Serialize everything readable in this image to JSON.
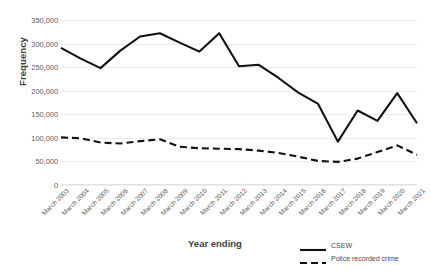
{
  "chart_data": {
    "type": "line",
    "title": "",
    "xlabel": "Year ending",
    "ylabel": "Frequency",
    "ylim": [
      0,
      350000
    ],
    "ytick_step": 50000,
    "grid": true,
    "legend_position": "bottom-right",
    "categories": [
      "March 2003",
      "March 2004",
      "March 2005",
      "March 2006",
      "March 2007",
      "March 2008",
      "March 2009",
      "March 2010",
      "March 2011",
      "March 2012",
      "March 2013",
      "March 2014",
      "March 2015",
      "March 2016",
      "March 2017",
      "March 2018",
      "March 2019",
      "March 2020",
      "March 2021"
    ],
    "ytick_labels": [
      "350,000",
      "300,000",
      "250,000",
      "200,000",
      "150,000",
      "100,000",
      "50,000",
      "0"
    ],
    "ytick_values": [
      350000,
      300000,
      250000,
      200000,
      150000,
      100000,
      50000,
      0
    ],
    "series": [
      {
        "name": "CSEW",
        "style": "solid",
        "color": "#111111",
        "values": [
          291000,
          268000,
          248000,
          285000,
          315000,
          322000,
          302000,
          283000,
          322000,
          252000,
          255000,
          227000,
          196000,
          172000,
          92000,
          158000,
          136000,
          195000,
          131000
        ]
      },
      {
        "name": "Police recorded crime",
        "style": "dashed",
        "color": "#111111",
        "values": [
          101000,
          99000,
          90000,
          88000,
          93000,
          97000,
          81000,
          78000,
          77000,
          76000,
          73000,
          68000,
          60000,
          51000,
          49000,
          56000,
          70000,
          84000,
          64000
        ]
      }
    ]
  },
  "legend": {
    "items": [
      {
        "label": "CSEW",
        "style": "solid"
      },
      {
        "label": "Police recorded crime",
        "style": "dashed"
      }
    ]
  }
}
